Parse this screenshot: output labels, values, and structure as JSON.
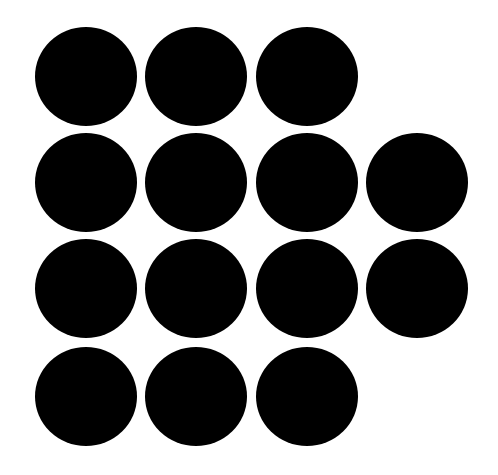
{
  "canvas": {
    "width": 498,
    "height": 475,
    "background": "#ffffff"
  },
  "dot_style": {
    "color": "#000000",
    "width": 102,
    "height": 99
  },
  "grid": {
    "col_x": [
      35,
      145,
      256,
      366
    ],
    "row_y": [
      27,
      133,
      239,
      347
    ]
  },
  "rows": [
    {
      "count": 3,
      "cols": [
        0,
        1,
        2
      ]
    },
    {
      "count": 4,
      "cols": [
        0,
        1,
        2,
        3
      ]
    },
    {
      "count": 4,
      "cols": [
        0,
        1,
        2,
        3
      ]
    },
    {
      "count": 3,
      "cols": [
        0,
        1,
        2
      ]
    }
  ],
  "total_dots": 14
}
